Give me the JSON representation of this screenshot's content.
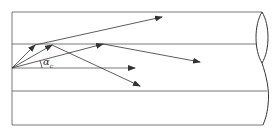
{
  "diagram": {
    "type": "optical-fiber-ray-propagation",
    "angle_label": "α",
    "angle_subscript": "c",
    "colors": {
      "line": "#444444",
      "background": "#ffffff"
    },
    "rays": [
      {
        "name": "ray-1",
        "points": [
          [
            12,
            68
          ],
          [
            35,
            45
          ],
          [
            162,
            17
          ]
        ]
      },
      {
        "name": "ray-2",
        "points": [
          [
            12,
            68
          ],
          [
            52,
            45
          ],
          [
            140,
            86
          ]
        ]
      },
      {
        "name": "ray-3",
        "points": [
          [
            12,
            68
          ],
          [
            103,
            44
          ],
          [
            200,
            62
          ]
        ]
      },
      {
        "name": "ray-axial",
        "points": [
          [
            12,
            68
          ],
          [
            135,
            68
          ]
        ]
      }
    ]
  }
}
